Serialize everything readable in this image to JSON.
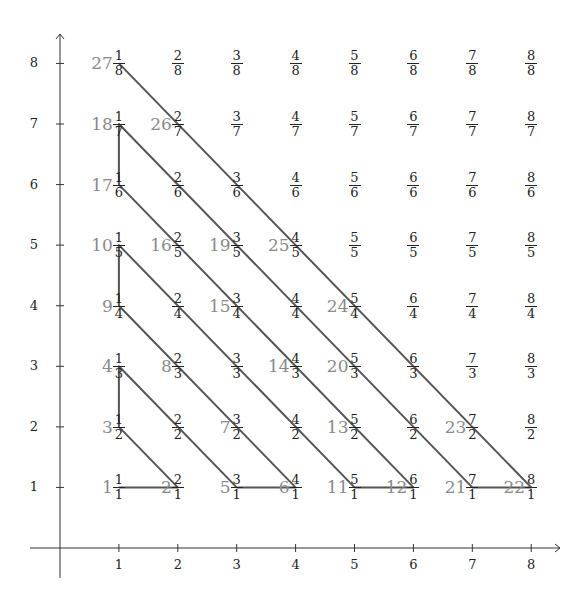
{
  "diagram": {
    "axes": {
      "x_ticks": [
        "1",
        "2",
        "3",
        "4",
        "5",
        "6",
        "7",
        "8"
      ],
      "y_ticks": [
        "1",
        "2",
        "3",
        "4",
        "5",
        "6",
        "7",
        "8"
      ],
      "origin_px": [
        60,
        548
      ],
      "x_step_px": 58.9,
      "y_step_px": 60.57
    },
    "colors": {
      "axis": "#333333",
      "path": "#555555",
      "fraction": "#222222",
      "index_label": "#8a8a8a"
    },
    "fractions_note": "Each grid point (p,q) shows the fraction p/q",
    "index_labels": [
      {
        "n": "1",
        "p": 1,
        "q": 1
      },
      {
        "n": "2",
        "p": 2,
        "q": 1
      },
      {
        "n": "3",
        "p": 1,
        "q": 2
      },
      {
        "n": "4",
        "p": 1,
        "q": 3
      },
      {
        "n": "5",
        "p": 3,
        "q": 1
      },
      {
        "n": "6",
        "p": 4,
        "q": 1
      },
      {
        "n": "7",
        "p": 3,
        "q": 2
      },
      {
        "n": "8",
        "p": 2,
        "q": 3
      },
      {
        "n": "9",
        "p": 1,
        "q": 4
      },
      {
        "n": "10",
        "p": 1,
        "q": 5
      },
      {
        "n": "11",
        "p": 5,
        "q": 1
      },
      {
        "n": "12",
        "p": 6,
        "q": 1
      },
      {
        "n": "13",
        "p": 5,
        "q": 2
      },
      {
        "n": "14",
        "p": 4,
        "q": 3
      },
      {
        "n": "15",
        "p": 3,
        "q": 4
      },
      {
        "n": "16",
        "p": 2,
        "q": 5
      },
      {
        "n": "17",
        "p": 1,
        "q": 6
      },
      {
        "n": "18",
        "p": 1,
        "q": 7
      },
      {
        "n": "19",
        "p": 3,
        "q": 5
      },
      {
        "n": "20",
        "p": 5,
        "q": 3
      },
      {
        "n": "21",
        "p": 7,
        "q": 1
      },
      {
        "n": "22",
        "p": 8,
        "q": 1
      },
      {
        "n": "23",
        "p": 7,
        "q": 2
      },
      {
        "n": "24",
        "p": 5,
        "q": 4
      },
      {
        "n": "25",
        "p": 4,
        "q": 5
      },
      {
        "n": "26",
        "p": 2,
        "q": 7
      },
      {
        "n": "27",
        "p": 1,
        "q": 8
      }
    ],
    "path": [
      [
        1,
        1
      ],
      [
        2,
        1
      ],
      [
        1,
        2
      ],
      [
        1,
        3
      ],
      [
        3,
        1
      ],
      [
        4,
        1
      ],
      [
        1,
        4
      ],
      [
        1,
        5
      ],
      [
        5,
        1
      ],
      [
        6,
        1
      ],
      [
        1,
        6
      ],
      [
        1,
        7
      ],
      [
        7,
        1
      ],
      [
        8,
        1
      ],
      [
        1,
        8
      ]
    ]
  }
}
